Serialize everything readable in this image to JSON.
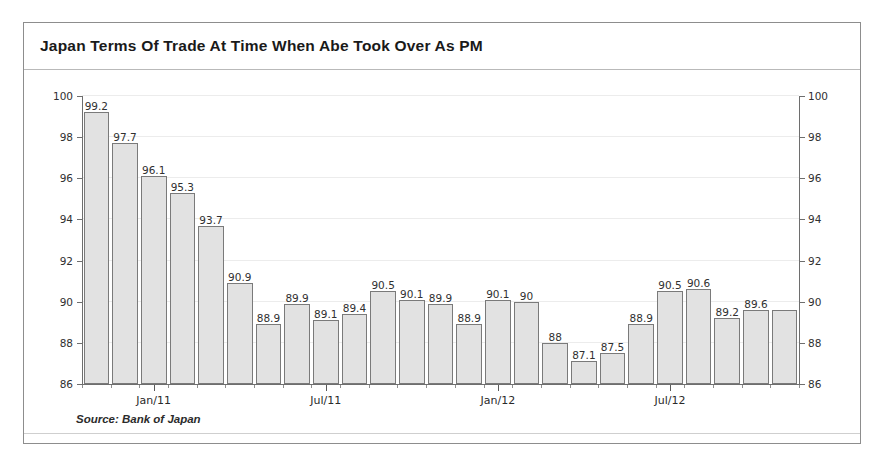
{
  "figure": {
    "title": "Japan Terms Of Trade At Time When Abe Took Over As PM",
    "source": "Source: Bank of Japan",
    "frame_color": "#8d8d8d",
    "bar_fill": "#e2e2e2",
    "bar_border": "#7a7a7a"
  },
  "chart_data": {
    "type": "bar",
    "title": "Japan Terms Of Trade At Time When Abe Took Over As PM",
    "xlabel": "",
    "ylabel": "",
    "ylim": [
      86,
      100
    ],
    "yticks": [
      86,
      88,
      90,
      92,
      94,
      96,
      98,
      100
    ],
    "ytick_labels": [
      "86",
      "88",
      "90",
      "92",
      "94",
      "96",
      "98",
      "100"
    ],
    "grid": true,
    "legend": false,
    "dual_axis": true,
    "right_axis_same_as_left": true,
    "bar_count": 25,
    "categories": [
      "Nov/10",
      "Dec/10",
      "Jan/11",
      "Feb/11",
      "Mar/11",
      "Apr/11",
      "May/11",
      "Jun/11",
      "Jul/11",
      "Aug/11",
      "Sep/11",
      "Oct/11",
      "Nov/11",
      "Dec/11",
      "Jan/12",
      "Feb/12",
      "Mar/12",
      "Apr/12",
      "May/12",
      "Jun/12",
      "Jul/12",
      "Aug/12",
      "Sep/12",
      "Oct/12",
      "Nov/12"
    ],
    "values": [
      99.2,
      97.7,
      96.1,
      95.3,
      93.7,
      90.9,
      88.9,
      89.9,
      89.1,
      89.4,
      90.5,
      90.1,
      89.9,
      88.9,
      90.1,
      90,
      88,
      87.1,
      87.5,
      88.9,
      90.5,
      90.6,
      89.2,
      89.6,
      89.6
    ],
    "value_labels": [
      "99.2",
      "97.7",
      "96.1",
      "95.3",
      "93.7",
      "90.9",
      "88.9",
      "89.9",
      "89.1",
      "89.4",
      "90.5",
      "90.1",
      "89.9",
      "88.9",
      "90.1",
      "90",
      "88",
      "87.1",
      "87.5",
      "88.9",
      "90.5",
      "90.6",
      "89.2",
      "89.6",
      ""
    ],
    "xtick_labels": [
      "Jan/11",
      "Jul/11",
      "Jan/12",
      "Jul/12"
    ],
    "xtick_indices": [
      2,
      8,
      14,
      20
    ]
  }
}
